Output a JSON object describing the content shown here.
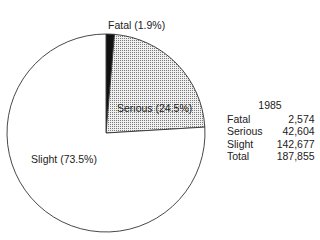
{
  "chart_data": {
    "type": "pie",
    "title": "1985",
    "categories": [
      "Fatal",
      "Serious",
      "Slight"
    ],
    "values": [
      2574,
      42604,
      142677
    ],
    "percentages": [
      1.9,
      24.5,
      73.5
    ],
    "slice_labels": [
      "Fatal (1.9%)",
      "Serious (24.5%)",
      "Slight (73.5%)"
    ],
    "fills": [
      "solid-black",
      "dotted-grey",
      "white"
    ],
    "total": 187855,
    "start_angle": "12 o'clock, clockwise",
    "legend_position": "right"
  },
  "colors": {
    "fatal": "#111111",
    "serious": "#d8d8d8",
    "slight": "#ffffff",
    "outline": "#333333"
  },
  "labels": {
    "fatal": "Fatal (1.9%)",
    "serious": "Serious (24.5%)",
    "slight": "Slight (73.5%)"
  },
  "legend": {
    "year": "1985",
    "rows": [
      {
        "label": "Fatal",
        "value": "2,574"
      },
      {
        "label": "Serious",
        "value": "42,604"
      },
      {
        "label": "Slight",
        "value": "142,677"
      },
      {
        "label": "Total",
        "value": "187,855"
      }
    ]
  }
}
